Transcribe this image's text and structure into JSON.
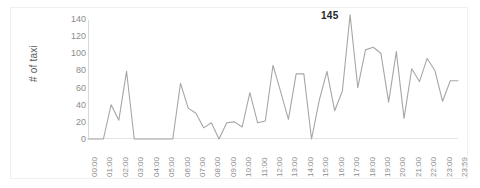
{
  "chart_data": {
    "type": "line",
    "title": "",
    "xlabel": "",
    "ylabel": "# of taxi",
    "ylim": [
      0,
      140
    ],
    "ytick_labels": [
      "140",
      "120",
      "100",
      "80",
      "60",
      "40",
      "20",
      "0"
    ],
    "ytick_values": [
      140,
      120,
      100,
      80,
      60,
      40,
      20,
      0
    ],
    "grid": false,
    "legend": "none",
    "line_color": "#a6a6a6",
    "annotations": [
      {
        "text": "145",
        "value": 145,
        "x": "17:00",
        "bold": true
      }
    ],
    "xtick_labels": [
      "00:00",
      "01:00",
      "02:00",
      "03:00",
      "04:00",
      "05:00",
      "06:00",
      "07:00",
      "08:00",
      "09:00",
      "10:00",
      "11:00",
      "12:00",
      "13:00",
      "14:00",
      "15:00",
      "16:00",
      "17:00",
      "18:00",
      "19:00",
      "20:00",
      "21:00",
      "22:00",
      "23:00",
      "23:59"
    ],
    "x": [
      "00:00",
      "00:30",
      "01:00",
      "01:30",
      "02:00",
      "02:30",
      "03:00",
      "03:30",
      "04:00",
      "04:30",
      "05:00",
      "05:30",
      "06:00",
      "06:30",
      "07:00",
      "07:30",
      "08:00",
      "08:30",
      "09:00",
      "09:30",
      "10:00",
      "10:30",
      "11:00",
      "11:30",
      "12:00",
      "12:30",
      "13:00",
      "13:30",
      "14:00",
      "14:30",
      "15:00",
      "15:30",
      "16:00",
      "16:30",
      "17:00",
      "17:30",
      "18:00",
      "18:30",
      "19:00",
      "19:30",
      "20:00",
      "20:30",
      "21:00",
      "21:30",
      "22:00",
      "22:30",
      "23:00",
      "23:30",
      "23:59"
    ],
    "values": [
      0,
      0,
      0,
      40,
      22,
      79,
      0,
      0,
      0,
      0,
      0,
      0,
      65,
      36,
      30,
      13,
      19,
      0,
      19,
      20,
      14,
      54,
      19,
      21,
      86,
      55,
      23,
      76,
      76,
      0,
      45,
      79,
      33,
      56,
      145,
      60,
      104,
      107,
      100,
      43,
      102,
      24,
      82,
      67,
      94,
      80,
      44,
      68,
      68
    ],
    "series_name": "# of taxi",
    "max_value": 145,
    "min_value": 0
  }
}
